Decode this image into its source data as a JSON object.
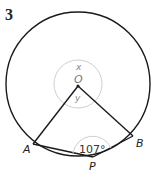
{
  "question_number": "3",
  "diagram": {
    "type": "circle-geometry",
    "center_label": "O",
    "angle_labels": {
      "reflex_at_center": "x",
      "angle_at_center": "y"
    },
    "points": [
      {
        "label": "A",
        "x": 33,
        "y": 144
      },
      {
        "label": "B",
        "x": 133,
        "y": 136
      },
      {
        "label": "P",
        "x": 93,
        "y": 157
      }
    ],
    "angle_APB": "107°",
    "colors": {
      "line": "#1a1a1a",
      "angle_arc": "#c8c8c8",
      "label_gray": "#777777"
    }
  }
}
